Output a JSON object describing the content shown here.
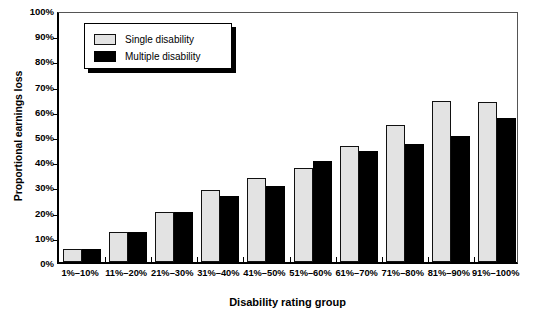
{
  "chart_data": {
    "type": "bar",
    "title": "",
    "xlabel": "Disability rating group",
    "ylabel": "Proportional earnings loss",
    "categories": [
      "1%–10%",
      "11%–20%",
      "21%–30%",
      "31%–40%",
      "41%–50%",
      "51%–60%",
      "61%–70%",
      "71%–80%",
      "81%–90%",
      "91%–100%"
    ],
    "series": [
      {
        "name": "Single disability",
        "color": "#e3e3e3",
        "values": [
          5,
          12,
          20,
          28.5,
          33.5,
          37.5,
          46,
          54.5,
          64,
          63.5
        ]
      },
      {
        "name": "Multiple disability",
        "color": "#000000",
        "values": [
          5,
          12,
          20,
          26,
          30,
          40,
          44,
          47,
          50,
          57
        ]
      }
    ],
    "ylim": [
      0,
      100
    ],
    "ytick_labels": [
      "0%",
      "10%",
      "20%",
      "30%",
      "40%",
      "50%",
      "60%",
      "70%",
      "80%",
      "90%",
      "100%"
    ],
    "ytick_values": [
      0,
      10,
      20,
      30,
      40,
      50,
      60,
      70,
      80,
      90,
      100
    ],
    "grid": false,
    "legend_position": "top-left",
    "legend_entries": [
      "Single disability",
      "Multiple disability"
    ]
  },
  "legend": {
    "single_label": "Single disability",
    "multiple_label": "Multiple disability"
  },
  "axes": {
    "y_title": "Proportional earnings loss",
    "x_title": "Disability rating group"
  }
}
